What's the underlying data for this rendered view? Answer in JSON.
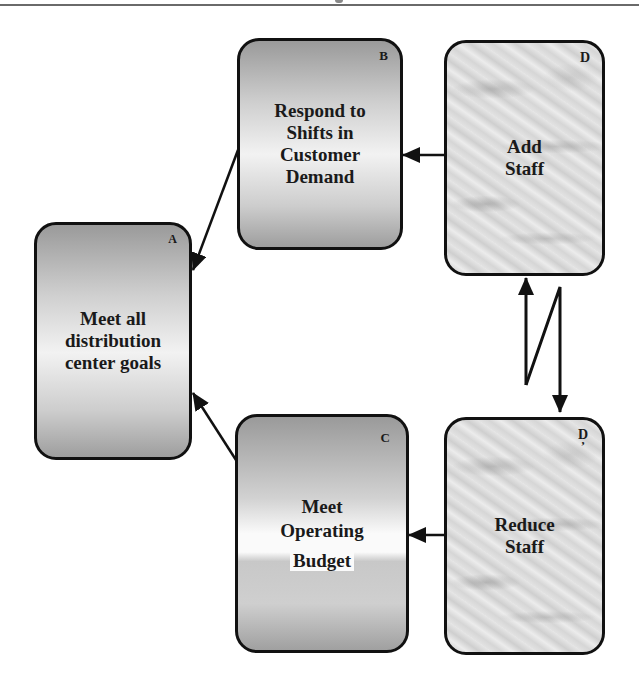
{
  "diagram": {
    "nodes": [
      {
        "id": "A",
        "tag": "A",
        "label_lines": [
          "Meet all",
          "distribution",
          "center goals"
        ],
        "fill": "gradient-gray"
      },
      {
        "id": "B",
        "tag": "B",
        "label_lines": [
          "Respond to",
          "Shifts in",
          "Customer",
          "Demand"
        ],
        "fill": "gradient-gray"
      },
      {
        "id": "C",
        "tag": "C",
        "label_lines": [
          "Meet",
          "Operating",
          "Budget"
        ],
        "fill": "gradient-gray"
      },
      {
        "id": "D",
        "tag": "D",
        "label_lines": [
          "Add",
          "Staff"
        ],
        "fill": "marble"
      },
      {
        "id": "D_prime",
        "tag": "D",
        "tag_suffix": "’",
        "label_lines": [
          "Reduce",
          "Staff"
        ],
        "fill": "marble"
      }
    ],
    "edges": [
      {
        "from": "B",
        "to": "A",
        "style": "arrow"
      },
      {
        "from": "C",
        "to": "A",
        "style": "arrow"
      },
      {
        "from": "D",
        "to": "B",
        "style": "arrow"
      },
      {
        "from": "D_prime",
        "to": "C",
        "style": "arrow"
      },
      {
        "from": "D",
        "to": "D_prime",
        "style": "conflict-zigzag",
        "note": "bidirectional arrow with lightning-bolt break"
      }
    ],
    "colors": {
      "border": "#111111",
      "arrow": "#111111",
      "gradient_dark": "#9a9a9a",
      "gradient_light": "#f2f2f2"
    }
  }
}
